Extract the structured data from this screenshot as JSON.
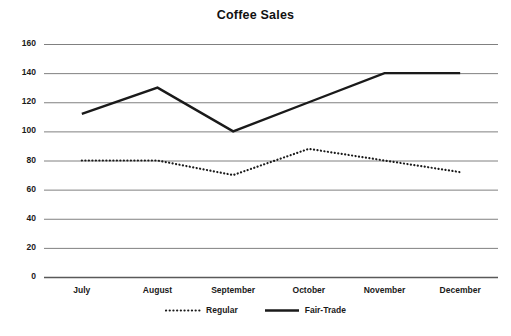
{
  "chart_data": {
    "type": "line",
    "title": "Coffee Sales",
    "xlabel": "",
    "ylabel": "",
    "categories": [
      "July",
      "August",
      "September",
      "October",
      "November",
      "December"
    ],
    "series": [
      {
        "name": "Regular",
        "style": "dotted",
        "color": "#1a1a1a",
        "values": [
          80,
          80,
          70,
          88,
          80,
          72
        ]
      },
      {
        "name": "Fair-Trade",
        "style": "solid",
        "color": "#1a1a1a",
        "values": [
          112,
          130,
          100,
          120,
          140,
          140
        ]
      }
    ],
    "ylim": [
      0,
      160
    ],
    "ytick_values": [
      160,
      140,
      120,
      100,
      80,
      60,
      40,
      20,
      0
    ],
    "ytick_labels": [
      "160",
      "140",
      "120",
      "100",
      "80",
      "60",
      "40",
      "20",
      "0"
    ],
    "grid": "horizontal",
    "legend_position": "bottom",
    "gridline_color": "#808080",
    "axis_color": "#595959",
    "background": "#ffffff"
  }
}
